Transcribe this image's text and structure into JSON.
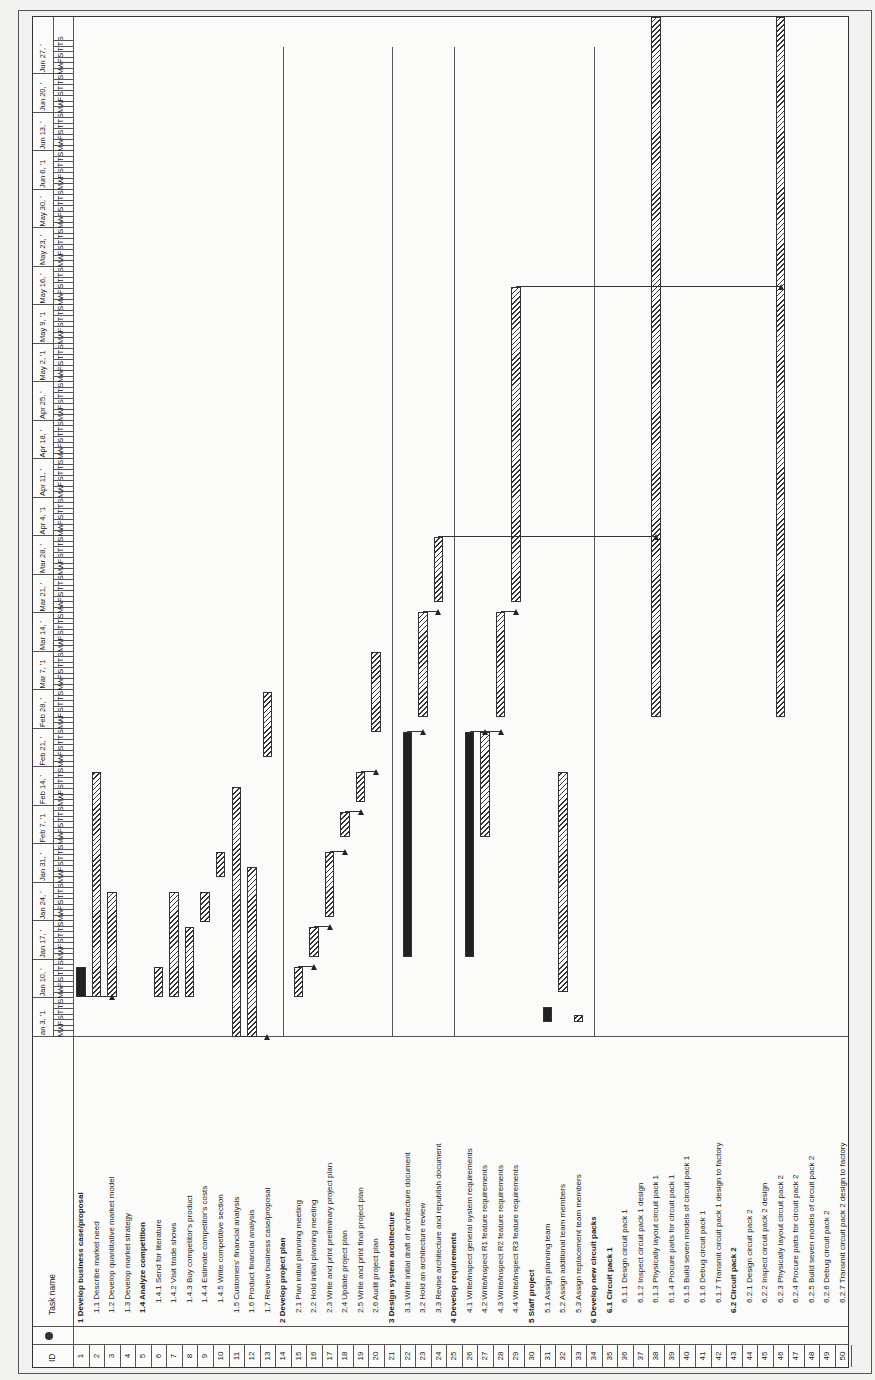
{
  "table": {
    "id_header": "ID",
    "indicator_header": "info-icon",
    "name_header": "Task name"
  },
  "tasks": [
    {
      "id": "1",
      "name": "1 Develop business case/proposal",
      "bold": true,
      "indent": 0
    },
    {
      "id": "2",
      "name": "1.1 Describe market need",
      "bold": false,
      "indent": 1
    },
    {
      "id": "3",
      "name": "1.2 Develop quantitative market model",
      "bold": false,
      "indent": 1
    },
    {
      "id": "4",
      "name": "1.3 Develop market strategy",
      "bold": false,
      "indent": 1
    },
    {
      "id": "5",
      "name": "1.4 Analyze competition",
      "bold": true,
      "indent": 1
    },
    {
      "id": "6",
      "name": "1.4.1 Send for literature",
      "bold": false,
      "indent": 2
    },
    {
      "id": "7",
      "name": "1.4.2 Visit trade shows",
      "bold": false,
      "indent": 2
    },
    {
      "id": "8",
      "name": "1.4.3 Buy competitor's product",
      "bold": false,
      "indent": 2
    },
    {
      "id": "9",
      "name": "1.4.4 Estimate competitor's costs",
      "bold": false,
      "indent": 2
    },
    {
      "id": "10",
      "name": "1.4.5 Write competitive section",
      "bold": false,
      "indent": 2
    },
    {
      "id": "11",
      "name": "1.5 Customers' financial analysis",
      "bold": false,
      "indent": 1
    },
    {
      "id": "12",
      "name": "1.6 Product financial analysis",
      "bold": false,
      "indent": 1
    },
    {
      "id": "13",
      "name": "1.7 Review business case/proposal",
      "bold": false,
      "indent": 1
    },
    {
      "id": "14",
      "name": "2 Develop project plan",
      "bold": true,
      "indent": 0
    },
    {
      "id": "15",
      "name": "2.1 Plan initial planning meeting",
      "bold": false,
      "indent": 1
    },
    {
      "id": "16",
      "name": "2.2 Hold initial planning meeting",
      "bold": false,
      "indent": 1
    },
    {
      "id": "17",
      "name": "2.3 Write and print preliminary project plan",
      "bold": false,
      "indent": 1
    },
    {
      "id": "18",
      "name": "2.4 Update project plan",
      "bold": false,
      "indent": 1
    },
    {
      "id": "19",
      "name": "2.5 Write and print final project plan",
      "bold": false,
      "indent": 1
    },
    {
      "id": "20",
      "name": "2.6 Audit project plan",
      "bold": false,
      "indent": 1
    },
    {
      "id": "21",
      "name": "3 Design system architecture",
      "bold": true,
      "indent": 0
    },
    {
      "id": "22",
      "name": "3.1 Write initial draft of architecture document",
      "bold": false,
      "indent": 1
    },
    {
      "id": "23",
      "name": "3.2 Hold an architecture review",
      "bold": false,
      "indent": 1
    },
    {
      "id": "24",
      "name": "3.3 Revise architecture and republish document",
      "bold": false,
      "indent": 1
    },
    {
      "id": "25",
      "name": "4 Develop requirements",
      "bold": true,
      "indent": 0
    },
    {
      "id": "26",
      "name": "4.1 Write/inspect general system requirements",
      "bold": false,
      "indent": 1
    },
    {
      "id": "27",
      "name": "4.2 Write/inspect R1 feature requirements",
      "bold": false,
      "indent": 1
    },
    {
      "id": "28",
      "name": "4.3 Write/inspect R2 feature requirements",
      "bold": false,
      "indent": 1
    },
    {
      "id": "29",
      "name": "4.4 Write/inspect R3 feature requirements",
      "bold": false,
      "indent": 1
    },
    {
      "id": "30",
      "name": "5 Staff project",
      "bold": true,
      "indent": 0
    },
    {
      "id": "31",
      "name": "5.1 Assign planning team",
      "bold": false,
      "indent": 1
    },
    {
      "id": "32",
      "name": "5.2 Assign additional team members",
      "bold": false,
      "indent": 1
    },
    {
      "id": "33",
      "name": "5.3 Assign replacement team members",
      "bold": false,
      "indent": 1
    },
    {
      "id": "34",
      "name": "6 Develop new circuit packs",
      "bold": true,
      "indent": 0
    },
    {
      "id": "35",
      "name": "6.1 Circuit pack 1",
      "bold": true,
      "indent": 1
    },
    {
      "id": "36",
      "name": "6.1.1 Design circuit pack 1",
      "bold": false,
      "indent": 2
    },
    {
      "id": "37",
      "name": "6.1.2 Inspect circuit pack 1 design",
      "bold": false,
      "indent": 2
    },
    {
      "id": "38",
      "name": "6.1.3 Physically layout circuit pack 1",
      "bold": false,
      "indent": 2
    },
    {
      "id": "39",
      "name": "6.1.4 Procure parts for circuit pack 1",
      "bold": false,
      "indent": 2
    },
    {
      "id": "40",
      "name": "6.1.5 Build seven models of circuit pack 1",
      "bold": false,
      "indent": 2
    },
    {
      "id": "41",
      "name": "6.1.6 Debug circuit pack 1",
      "bold": false,
      "indent": 2
    },
    {
      "id": "42",
      "name": "6.1.7 Transmit circuit pack 1 design to factory",
      "bold": false,
      "indent": 2
    },
    {
      "id": "43",
      "name": "6.2 Circuit pack 2",
      "bold": true,
      "indent": 1
    },
    {
      "id": "44",
      "name": "6.2.1 Design circuit pack 2",
      "bold": false,
      "indent": 2
    },
    {
      "id": "45",
      "name": "6.2.2 Inspect circuit pack 2 design",
      "bold": false,
      "indent": 2
    },
    {
      "id": "46",
      "name": "6.2.3 Physically layout circuit pack 2",
      "bold": false,
      "indent": 2
    },
    {
      "id": "47",
      "name": "6.2.4 Procure parts for circuit  pack 2",
      "bold": false,
      "indent": 2
    },
    {
      "id": "48",
      "name": "6.2.5 Build seven models of circuit pack 2",
      "bold": false,
      "indent": 2
    },
    {
      "id": "49",
      "name": "6.2.6 Debug circuit pack 2",
      "bold": false,
      "indent": 2
    },
    {
      "id": "50",
      "name": "6.2.7 Transmit circuit pack 2 design to factory",
      "bold": false,
      "indent": 2
    }
  ],
  "timescale": {
    "weeks": [
      "an 3, '1",
      "Jan 10, '",
      "Jan 17, '",
      "Jan 24, '",
      "Jan 31, '",
      "Feb 7, '1",
      "Feb 14, '",
      "Feb 21, '",
      "Feb 28, '",
      "Mar 7, '1",
      "Mar 14, '",
      "Mar 21, '",
      "Mar 28, '",
      "Apr 4, '1",
      "Apr 11, '",
      "Apr 18, '",
      "Apr 25, '",
      "May 2, '1",
      "May 9, '1",
      "May 16, '",
      "May 23, '",
      "May 30, '",
      "Jun 6, '1",
      "Jun 13, '",
      "Jun 20, '",
      "Jun 27, '"
    ],
    "day_pattern": [
      "M",
      "W",
      "F",
      "S",
      "T",
      "T",
      "S"
    ]
  },
  "chart_data": {
    "type": "gantt",
    "orientation": "rotated-90-ccw",
    "title": "",
    "time_axis": {
      "start": "Jan 3",
      "end": "Jul 2",
      "unit": "week",
      "px_per_week": 38.5
    },
    "bars": [
      {
        "row": 1,
        "start_px": 40,
        "end_px": 70,
        "style": "dark"
      },
      {
        "row": 2,
        "start_px": 40,
        "end_px": 265,
        "style": "hatched"
      },
      {
        "row": 3,
        "start_px": 40,
        "end_px": 145,
        "style": "hatched"
      },
      {
        "row": 6,
        "start_px": 40,
        "end_px": 70,
        "style": "hatched"
      },
      {
        "row": 7,
        "start_px": 40,
        "end_px": 145,
        "style": "hatched"
      },
      {
        "row": 8,
        "start_px": 40,
        "end_px": 110,
        "style": "hatched"
      },
      {
        "row": 9,
        "start_px": 115,
        "end_px": 145,
        "style": "hatched"
      },
      {
        "row": 10,
        "start_px": 160,
        "end_px": 185,
        "style": "hatched"
      },
      {
        "row": 11,
        "start_px": 0,
        "end_px": 250,
        "style": "hatched"
      },
      {
        "row": 12,
        "start_px": 0,
        "end_px": 170,
        "style": "hatched"
      },
      {
        "row": 13,
        "start_px": 280,
        "end_px": 345,
        "style": "hatched"
      },
      {
        "row": 15,
        "start_px": 40,
        "end_px": 70,
        "style": "hatched"
      },
      {
        "row": 16,
        "start_px": 80,
        "end_px": 110,
        "style": "hatched"
      },
      {
        "row": 17,
        "start_px": 120,
        "end_px": 185,
        "style": "hatched"
      },
      {
        "row": 18,
        "start_px": 200,
        "end_px": 225,
        "style": "hatched"
      },
      {
        "row": 19,
        "start_px": 235,
        "end_px": 265,
        "style": "hatched"
      },
      {
        "row": 20,
        "start_px": 305,
        "end_px": 385,
        "style": "hatched"
      },
      {
        "row": 22,
        "start_px": 80,
        "end_px": 305,
        "style": "dark"
      },
      {
        "row": 23,
        "start_px": 320,
        "end_px": 425,
        "style": "hatched"
      },
      {
        "row": 24,
        "start_px": 435,
        "end_px": 500,
        "style": "hatched"
      },
      {
        "row": 26,
        "start_px": 80,
        "end_px": 305,
        "style": "dark"
      },
      {
        "row": 27,
        "start_px": 200,
        "end_px": 305,
        "style": "hatched"
      },
      {
        "row": 28,
        "start_px": 320,
        "end_px": 425,
        "style": "hatched"
      },
      {
        "row": 29,
        "start_px": 435,
        "end_px": 750,
        "style": "hatched"
      },
      {
        "row": 31,
        "start_px": 15,
        "end_px": 30,
        "style": "dark"
      },
      {
        "row": 32,
        "start_px": 45,
        "end_px": 265,
        "style": "hatched"
      },
      {
        "row": 33,
        "start_px": 15,
        "end_px": 22,
        "style": "hatched"
      },
      {
        "row": 38,
        "start_px": 320,
        "end_px": 1020,
        "style": "hatched"
      },
      {
        "row": 46,
        "start_px": 320,
        "end_px": 1020,
        "style": "hatched"
      }
    ]
  }
}
